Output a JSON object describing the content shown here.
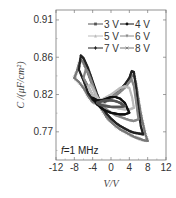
{
  "chart_data": {
    "type": "line",
    "title": "",
    "xlabel": "V/V",
    "ylabel": "C /(μF/cm²)",
    "xlim": [
      -12,
      12
    ],
    "ylim": [
      0.739,
      0.92
    ],
    "xticks": [
      -12,
      -8,
      -4,
      0,
      4,
      8,
      12
    ],
    "xtick_labels": [
      "-12",
      "-8",
      "-4",
      "0",
      "4",
      "8",
      "12"
    ],
    "yticks": [
      0.908,
      0.863,
      0.818,
      0.773
    ],
    "ytick_labels": [
      "0.91",
      "0.86",
      "0.82",
      "0.77"
    ],
    "grid": false,
    "legend_position": "top-right",
    "annotation": "f=1 MHz",
    "annotation_parts": {
      "italic": "f",
      "rest": "=1 MHz"
    },
    "series": [
      {
        "name": "3 V",
        "color": "#555555",
        "marker": "square",
        "x": [
          -3,
          -2.5,
          -2,
          -1,
          0,
          1,
          2,
          3,
          2.5,
          2,
          1,
          0,
          -1,
          -2,
          -3
        ],
        "y": [
          0.808,
          0.806,
          0.805,
          0.804,
          0.803,
          0.803,
          0.803,
          0.804,
          0.806,
          0.808,
          0.81,
          0.811,
          0.811,
          0.81,
          0.808
        ]
      },
      {
        "name": "4 V",
        "color": "#111111",
        "marker": "circle",
        "x": [
          -4,
          -3,
          -2,
          -1,
          0,
          1,
          2,
          3,
          4,
          3.5,
          3,
          2,
          1,
          0,
          -1,
          -2,
          -3,
          -4
        ],
        "y": [
          0.814,
          0.806,
          0.801,
          0.798,
          0.796,
          0.795,
          0.794,
          0.794,
          0.796,
          0.802,
          0.808,
          0.813,
          0.815,
          0.815,
          0.813,
          0.811,
          0.811,
          0.814
        ]
      },
      {
        "name": "5 V",
        "color": "#bbbbbb",
        "marker": "triangle-up",
        "x": [
          -5,
          -4.5,
          -4,
          -3,
          -2,
          -1,
          0,
          1,
          2,
          3,
          4,
          5,
          4.6,
          4,
          3,
          2,
          1,
          0,
          -1,
          -2,
          -3,
          -4,
          -5
        ],
        "y": [
          0.828,
          0.83,
          0.826,
          0.815,
          0.808,
          0.805,
          0.803,
          0.802,
          0.801,
          0.8,
          0.8,
          0.802,
          0.815,
          0.826,
          0.828,
          0.826,
          0.822,
          0.818,
          0.815,
          0.812,
          0.812,
          0.818,
          0.828
        ]
      },
      {
        "name": "6 V",
        "color": "#888888",
        "marker": "triangle-down",
        "x": [
          -6,
          -5.5,
          -5,
          -4,
          -3,
          -2,
          -1,
          0,
          1,
          2,
          3,
          4,
          5,
          6,
          5.5,
          5,
          4.5,
          4,
          3,
          2,
          1,
          0,
          -1,
          -2,
          -3,
          -4,
          -5,
          -6
        ],
        "y": [
          0.838,
          0.848,
          0.845,
          0.83,
          0.815,
          0.806,
          0.8,
          0.796,
          0.793,
          0.791,
          0.789,
          0.787,
          0.786,
          0.788,
          0.808,
          0.828,
          0.836,
          0.833,
          0.826,
          0.822,
          0.818,
          0.815,
          0.812,
          0.81,
          0.811,
          0.817,
          0.828,
          0.838
        ]
      },
      {
        "name": "7 V",
        "color": "#222222",
        "marker": "star",
        "x": [
          -7,
          -6.6,
          -6,
          -5,
          -4,
          -3,
          -2,
          -1,
          0,
          1,
          2,
          3,
          4,
          5,
          6,
          7,
          6.5,
          6,
          5.5,
          5,
          4.5,
          4,
          3,
          2,
          1,
          0,
          -1,
          -2,
          -3,
          -4,
          -5,
          -6,
          -7
        ],
        "y": [
          0.848,
          0.865,
          0.862,
          0.85,
          0.834,
          0.818,
          0.804,
          0.795,
          0.789,
          0.784,
          0.78,
          0.777,
          0.774,
          0.772,
          0.771,
          0.77,
          0.78,
          0.8,
          0.825,
          0.845,
          0.846,
          0.838,
          0.83,
          0.824,
          0.819,
          0.815,
          0.811,
          0.808,
          0.808,
          0.812,
          0.82,
          0.835,
          0.848
        ]
      },
      {
        "name": "8 V",
        "color": "#777777",
        "marker": "x",
        "x": [
          -8,
          -7.5,
          -7,
          -6.5,
          -6,
          -5,
          -4,
          -3,
          -2,
          -1,
          0,
          1,
          2,
          3,
          4,
          5,
          6,
          7,
          8,
          7.5,
          7,
          6.5,
          6,
          5.5,
          5,
          4.5,
          4,
          3,
          2,
          1,
          0,
          -1,
          -2,
          -3,
          -4,
          -5,
          -6,
          -7,
          -8
        ],
        "y": [
          0.838,
          0.845,
          0.855,
          0.86,
          0.856,
          0.843,
          0.828,
          0.812,
          0.8,
          0.791,
          0.785,
          0.78,
          0.776,
          0.773,
          0.77,
          0.767,
          0.765,
          0.763,
          0.762,
          0.77,
          0.782,
          0.795,
          0.812,
          0.83,
          0.842,
          0.84,
          0.834,
          0.827,
          0.821,
          0.817,
          0.813,
          0.81,
          0.807,
          0.806,
          0.809,
          0.816,
          0.826,
          0.833,
          0.838
        ]
      }
    ]
  }
}
